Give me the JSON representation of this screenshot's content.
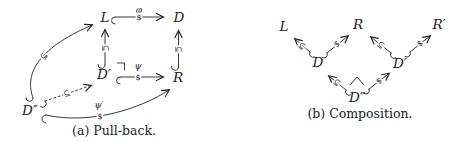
{
  "colors": {
    "ink": "#222222",
    "background": "#ffffff"
  },
  "icons": {
    "pullback_corner": "⌝",
    "wedge": "∧"
  },
  "panel_a": {
    "caption": "(a) Pull-back.",
    "nodes": {
      "L": "L",
      "D": "D",
      "D_prime": "D′",
      "R": "R",
      "D_dprime": "D″"
    },
    "edge_labels": {
      "phi": "φ",
      "psi": "ψ",
      "psi_prime": "ψ′",
      "dollar": "$",
      "subset": "⊆"
    }
  },
  "panel_b": {
    "caption": "(b) Composition.",
    "nodes": {
      "L": "L",
      "R": "R",
      "R_prime": "R′",
      "D": "D",
      "D_prime": "D′",
      "D_dprime": "D″"
    },
    "edge_labels": {
      "dollar": "$",
      "subset": "⊆"
    }
  }
}
